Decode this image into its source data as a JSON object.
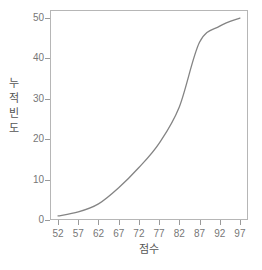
{
  "chart_data": {
    "type": "line",
    "title": "",
    "subtitle": "",
    "xlabel": "점수",
    "ylabel": "누적빈도",
    "ylabel_chars": [
      "누",
      "적",
      "빈",
      "도"
    ],
    "x": [
      52,
      57,
      62,
      67,
      72,
      77,
      82,
      87,
      92,
      97
    ],
    "values": [
      1,
      2,
      4,
      8,
      13,
      19,
      28,
      44,
      48,
      50
    ],
    "series": [
      {
        "name": "누적빈도",
        "x": [
          52,
          57,
          62,
          67,
          72,
          77,
          82,
          87,
          92,
          97
        ],
        "values": [
          1,
          2,
          4,
          8,
          13,
          19,
          28,
          44,
          48,
          50
        ]
      }
    ],
    "xticks": [
      52,
      57,
      62,
      67,
      72,
      77,
      82,
      87,
      92,
      97
    ],
    "xtick_labels": [
      "52",
      "57",
      "62",
      "67",
      "72",
      "77",
      "82",
      "87",
      "92",
      "97"
    ],
    "yticks": [
      0,
      10,
      20,
      30,
      40,
      50
    ],
    "ytick_labels": [
      "0",
      "10",
      "20",
      "30",
      "40",
      "50"
    ],
    "xlim": [
      50,
      99
    ],
    "ylim": [
      0,
      52
    ],
    "grid": false,
    "legend": false,
    "legend_position": "none",
    "line_color": "#848484",
    "frame_color": "#b6b6b6",
    "tick_color": "#9a9a9a",
    "text_color": "#777777",
    "background": "#ffffff",
    "smooth": true
  }
}
